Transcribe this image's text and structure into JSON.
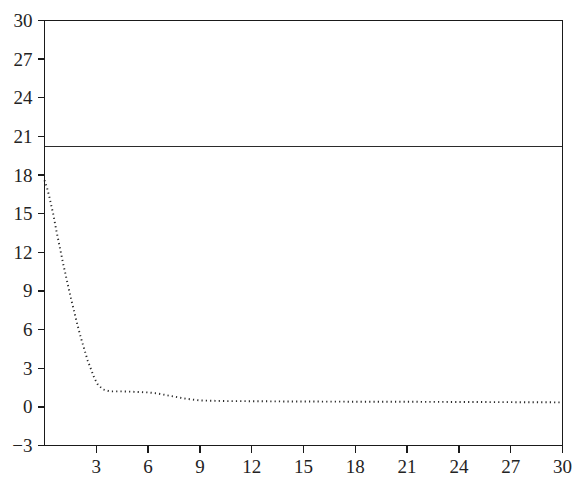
{
  "chart_data": {
    "type": "line",
    "title": "",
    "subtitle": "",
    "xlabel": "",
    "ylabel": "",
    "xlim": [
      0,
      30
    ],
    "ylim": [
      -3,
      30
    ],
    "xticks": [
      3,
      6,
      9,
      12,
      15,
      18,
      21,
      24,
      27,
      30
    ],
    "yticks": [
      -3,
      0,
      3,
      6,
      9,
      12,
      15,
      18,
      21,
      24,
      27,
      30
    ],
    "xtick_labels": [
      "3",
      "6",
      "9",
      "12",
      "15",
      "18",
      "21",
      "24",
      "27",
      "30"
    ],
    "ytick_labels": [
      "-3",
      "0",
      "3",
      "6",
      "9",
      "12",
      "15",
      "18",
      "21",
      "24",
      "27",
      "30"
    ],
    "grid": false,
    "legend": "none",
    "frame": "box",
    "series": [
      {
        "name": "constant-reference",
        "style": "solid",
        "color": "#2b2b2b",
        "x": [
          0,
          30
        ],
        "values": [
          20.2,
          20.2
        ]
      },
      {
        "name": "decaying-curve",
        "style": "dotted",
        "color": "#2a2a2a",
        "x": [
          0.0,
          0.15,
          0.3,
          0.5,
          0.7,
          0.9,
          1.1,
          1.3,
          1.5,
          1.7,
          1.9,
          2.1,
          2.3,
          2.5,
          2.7,
          2.9,
          3.1,
          3.4,
          3.8,
          4.2,
          4.6,
          5.0,
          5.5,
          6.0,
          6.5,
          6.9,
          7.3,
          7.7,
          8.1,
          8.5,
          9.0,
          9.5,
          10.5,
          12.0,
          14.0,
          16.0,
          18.0,
          20.0,
          22.0,
          24.0,
          26.0,
          28.0,
          30.0
        ],
        "values": [
          17.6,
          17.0,
          16.2,
          15.0,
          13.6,
          12.3,
          11.0,
          9.8,
          8.6,
          7.5,
          6.4,
          5.4,
          4.5,
          3.6,
          2.9,
          2.2,
          1.7,
          1.35,
          1.2,
          1.2,
          1.2,
          1.18,
          1.15,
          1.12,
          1.05,
          0.95,
          0.85,
          0.75,
          0.65,
          0.58,
          0.5,
          0.48,
          0.45,
          0.44,
          0.42,
          0.41,
          0.4,
          0.4,
          0.39,
          0.38,
          0.37,
          0.36,
          0.35
        ]
      }
    ]
  },
  "axes": {
    "colors": {
      "axis": "#1a1a1a",
      "tick_text": "#232323",
      "background": "#ffffff"
    }
  }
}
